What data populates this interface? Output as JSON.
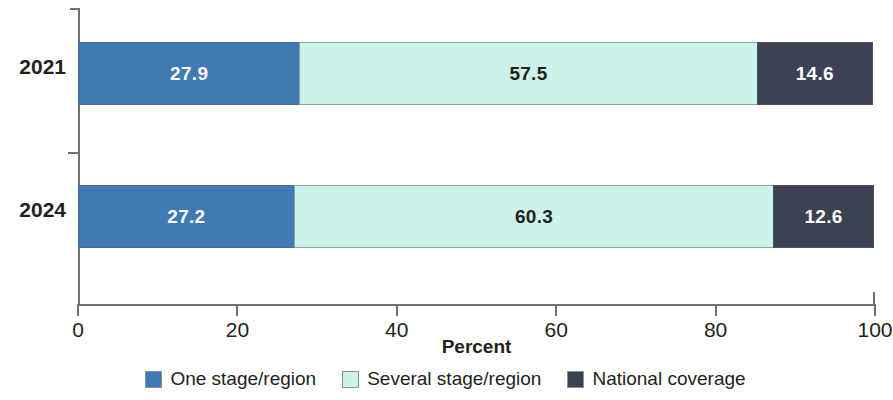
{
  "chart_data": {
    "type": "bar",
    "orientation": "horizontal",
    "stacked": true,
    "title": "",
    "xlabel": "Percent",
    "ylabel": "",
    "xlim": [
      0,
      100
    ],
    "xticks": [
      "0",
      "20",
      "40",
      "60",
      "80",
      "100"
    ],
    "grid": false,
    "legend_position": "bottom",
    "categories": [
      "2021",
      "2024"
    ],
    "series": [
      {
        "name": "One stage/region",
        "color": "#4079B4",
        "label_color": "#ffffff",
        "values": [
          27.9,
          27.2
        ],
        "labels": [
          "27.9",
          "27.2"
        ]
      },
      {
        "name": "Several stage/region",
        "color": "#CBF3EA",
        "label_color": "#231f20",
        "values": [
          57.5,
          60.3
        ],
        "labels": [
          "57.5",
          "60.3"
        ]
      },
      {
        "name": "National coverage",
        "color": "#3C4154",
        "label_color": "#ffffff",
        "values": [
          14.6,
          12.6
        ],
        "labels": [
          "14.6",
          "12.6"
        ]
      }
    ]
  },
  "axis": {
    "x_title": "Percent",
    "ticks": [
      {
        "label": "0",
        "value": 0
      },
      {
        "label": "20",
        "value": 20
      },
      {
        "label": "40",
        "value": 40
      },
      {
        "label": "60",
        "value": 60
      },
      {
        "label": "80",
        "value": 80
      },
      {
        "label": "100",
        "value": 100
      }
    ]
  },
  "legend": {
    "items": [
      {
        "label": "One stage/region",
        "color": "#4079B4"
      },
      {
        "label": "Several stage/region",
        "color": "#CBF3EA"
      },
      {
        "label": "National coverage",
        "color": "#3C4154"
      }
    ]
  }
}
